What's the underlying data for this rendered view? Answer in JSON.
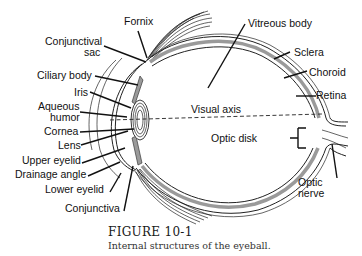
{
  "figure": {
    "title": "FIGURE 10-1",
    "caption": "Internal structures of the eyeball."
  },
  "labels": {
    "fornix": "Fornix",
    "conjunctival_sac_1": "Conjunctival",
    "conjunctival_sac_2": "sac",
    "ciliary_body": "Ciliary body",
    "iris": "Iris",
    "aqueous_humor_1": "Aqueous",
    "aqueous_humor_2": "humor",
    "cornea": "Cornea",
    "lens": "Lens",
    "upper_eyelid": "Upper eyelid",
    "drainage_angle": "Drainage angle",
    "lower_eyelid": "Lower eyelid",
    "conjunctiva": "Conjunctiva",
    "vitreous_body": "Vitreous body",
    "sclera": "Sclera",
    "choroid": "Choroid",
    "retina": "Retina",
    "visual_axis": "Visual axis",
    "optic_disk": "Optic disk",
    "optic_nerve_1": "Optic",
    "optic_nerve_2": "nerve"
  },
  "colors": {
    "line": "#111111",
    "choroid_fill": "#9a9a9a",
    "background": "#ffffff"
  }
}
